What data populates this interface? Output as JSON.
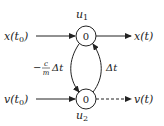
{
  "diagram": {
    "type": "signal-flow-graph",
    "nodes": [
      {
        "id": "u1",
        "label": "u",
        "subscript": "1",
        "value": "0"
      },
      {
        "id": "u2",
        "label": "u",
        "subscript": "2",
        "value": "0"
      }
    ],
    "inputs": [
      {
        "text": "x(t",
        "sub": "0",
        "close": ")"
      },
      {
        "text": "v(t",
        "sub": "0",
        "close": ")"
      }
    ],
    "outputs": [
      {
        "text": "x(t)",
        "line_style": "solid"
      },
      {
        "text": "v(t)",
        "line_style": "dashed"
      }
    ],
    "edges": [
      {
        "from": "u1",
        "to": "u2",
        "label_prefix": "−",
        "label_num": "c",
        "label_den": "m",
        "label_suffix": "Δt"
      },
      {
        "from": "u2",
        "to": "u1",
        "label": "Δt"
      }
    ],
    "colors": {
      "stroke": "#222222",
      "background": "#ffffff"
    }
  }
}
